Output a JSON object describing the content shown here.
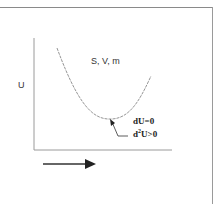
{
  "diagram": {
    "y_axis_label": "U",
    "curve_label": "S, V, m",
    "annotation_line1": "dU=0",
    "annotation_line2_prefix": "d",
    "annotation_line2_sup": "2",
    "annotation_line2_suffix": "U>0",
    "direction_arrow": "right-arrow"
  }
}
